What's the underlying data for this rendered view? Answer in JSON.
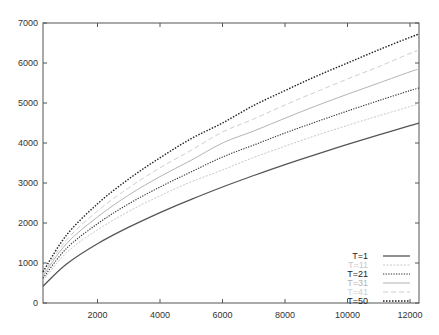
{
  "chart_data": {
    "type": "line",
    "title": "",
    "xlabel": "",
    "ylabel": "",
    "xlim": [
      256,
      12288
    ],
    "ylim": [
      0,
      7000
    ],
    "grid": false,
    "legend_position": "lower right",
    "xticks": [
      2000,
      4000,
      6000,
      8000,
      10000,
      12000
    ],
    "yticks": [
      0,
      1000,
      2000,
      3000,
      4000,
      5000,
      6000,
      7000
    ],
    "x": [
      256,
      1000,
      2000,
      3000,
      4000,
      5000,
      6000,
      7000,
      8000,
      9000,
      10000,
      11000,
      12000,
      12288
    ],
    "series": [
      {
        "name": "T=1",
        "color": "#555555",
        "dash": "",
        "width": 1.3,
        "values": [
          420,
          967,
          1481,
          1895,
          2259,
          2591,
          2900,
          3187,
          3461,
          3718,
          3964,
          4203,
          4435,
          4500
        ]
      },
      {
        "name": "T=11",
        "color": "#c8c8c8",
        "dash": "2,1.5",
        "width": 1.0,
        "values": [
          560,
          1250,
          1830,
          2290,
          2680,
          3030,
          3325,
          3640,
          3920,
          4190,
          4440,
          4680,
          4910,
          4975
        ]
      },
      {
        "name": "T=21",
        "color": "#333333",
        "dash": "1.3,1.3",
        "width": 1.1,
        "values": [
          620,
          1360,
          1980,
          2480,
          2900,
          3280,
          3650,
          3950,
          4250,
          4530,
          4800,
          5060,
          5310,
          5375
        ]
      },
      {
        "name": "T=31",
        "color": "#b4b4b4",
        "dash": "",
        "width": 1.0,
        "values": [
          680,
          1480,
          2150,
          2700,
          3160,
          3570,
          4000,
          4300,
          4620,
          4930,
          5220,
          5500,
          5780,
          5850
        ]
      },
      {
        "name": "T=41",
        "color": "#cfcfcf",
        "dash": "5,3",
        "width": 1.0,
        "values": [
          720,
          1570,
          2300,
          2880,
          3380,
          3820,
          4275,
          4600,
          4950,
          5280,
          5600,
          5910,
          6240,
          6325
        ]
      },
      {
        "name": "T=50",
        "color": "#222222",
        "dash": "1.5,1.5",
        "width": 1.4,
        "values": [
          780,
          1690,
          2480,
          3100,
          3630,
          4110,
          4500,
          4940,
          5310,
          5670,
          6000,
          6330,
          6640,
          6725
        ]
      }
    ]
  }
}
